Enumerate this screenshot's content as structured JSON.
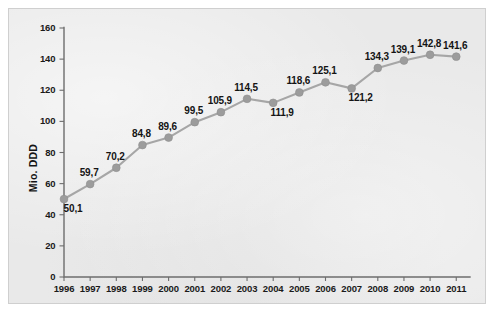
{
  "chart_data": {
    "type": "line",
    "title": "",
    "subtitle": "",
    "xlabel": "",
    "ylabel": "Mio. DDD",
    "categories": [
      "1996",
      "1997",
      "1998",
      "1999",
      "2000",
      "2001",
      "2002",
      "2003",
      "2004",
      "2005",
      "2006",
      "2007",
      "2008",
      "2009",
      "2010",
      "2011"
    ],
    "values": [
      50.1,
      59.7,
      70.2,
      84.8,
      89.6,
      99.5,
      105.9,
      114.5,
      111.9,
      118.6,
      125.1,
      121.2,
      134.3,
      139.1,
      142.8,
      141.6
    ],
    "data_labels": [
      "50,1",
      "59,7",
      "70,2",
      "84,8",
      "89,6",
      "99,5",
      "105,9",
      "114,5",
      "111,9",
      "118,6",
      "125,1",
      "121,2",
      "134,3",
      "139,1",
      "142,8",
      "141,6"
    ],
    "label_positions": [
      "below",
      "above",
      "above",
      "above",
      "above",
      "above",
      "above",
      "above",
      "below",
      "above",
      "above",
      "below",
      "above",
      "above",
      "above",
      "above"
    ],
    "ylim": [
      0,
      160
    ],
    "yticks": [
      0,
      20,
      40,
      60,
      80,
      100,
      120,
      140,
      160
    ],
    "ytick_labels": [
      "0",
      "20",
      "40",
      "60",
      "80",
      "100",
      "120",
      "140",
      "160"
    ],
    "xtick_labels": [
      "1996",
      "1997",
      "1998",
      "1999",
      "2000",
      "2001",
      "2002",
      "2003",
      "2004",
      "2005",
      "2006",
      "2007",
      "2008",
      "2009",
      "2010",
      "2011"
    ],
    "grid": false,
    "legend": false,
    "legend_position": "none",
    "series": [
      {
        "name": "Mio. DDD",
        "values": [
          50.1,
          59.7,
          70.2,
          84.8,
          89.6,
          99.5,
          105.9,
          114.5,
          111.9,
          118.6,
          125.1,
          121.2,
          134.3,
          139.1,
          142.8,
          141.6
        ]
      }
    ],
    "colors": {
      "line": "#a6a6a6",
      "marker": "#9c9c9c",
      "axis": "#6d6d6d",
      "label_text": "#141414",
      "panel_background": "#e9e9e9",
      "page_background": "#ffffff",
      "panel_border": "#cfcfcf"
    }
  }
}
